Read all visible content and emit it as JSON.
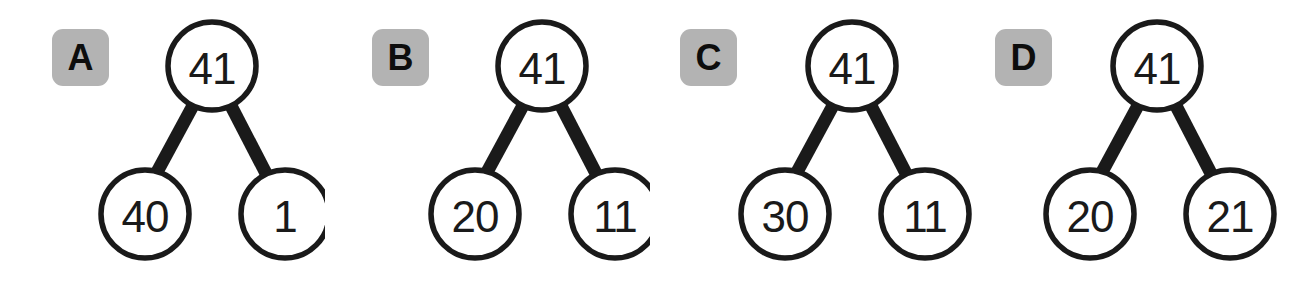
{
  "figure": {
    "background_color": "#ffffff",
    "label_badge_color": "#b3b3b3",
    "stroke_color": "#1a1a1a",
    "node_fill_color": "#ffffff",
    "panel_count": 4
  },
  "panels": [
    {
      "label": "A",
      "root": "41",
      "left_child": "40",
      "right_child": "1"
    },
    {
      "label": "B",
      "root": "41",
      "left_child": "20",
      "right_child": "11"
    },
    {
      "label": "C",
      "root": "41",
      "left_child": "30",
      "right_child": "11"
    },
    {
      "label": "D",
      "root": "41",
      "left_child": "20",
      "right_child": "21"
    }
  ]
}
